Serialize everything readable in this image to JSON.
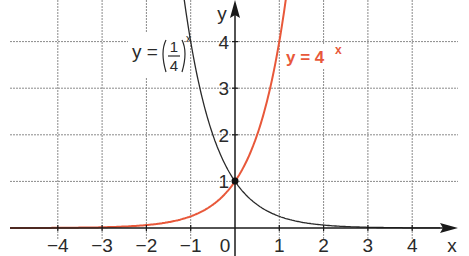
{
  "chart_data": {
    "type": "line",
    "title": "",
    "xlabel": "x",
    "ylabel": "y",
    "xlim": [
      -5,
      5
    ],
    "ylim": [
      0,
      5
    ],
    "grid": true,
    "x_ticks": [
      "-4",
      "-3",
      "-2",
      "-1",
      "0",
      "1",
      "2",
      "3",
      "4"
    ],
    "y_ticks": [
      "1",
      "2",
      "3",
      "4"
    ],
    "series": [
      {
        "name": "y = 4^x",
        "label": "y = 4",
        "label_exp": "x",
        "color": "#e8583a",
        "x": [
          -5,
          -4,
          -3,
          -2,
          -1,
          -0.5,
          0,
          0.5,
          1,
          1.1
        ],
        "values": [
          0.001,
          0.004,
          0.016,
          0.0625,
          0.25,
          0.5,
          1,
          2,
          4,
          4.59
        ]
      },
      {
        "name": "y = (1/4)^x",
        "label_prefix": "y =",
        "label_num": "1",
        "label_den": "4",
        "label_exp": "x",
        "color": "#2a2a2a",
        "x": [
          -1.1,
          -1,
          -0.5,
          0,
          0.5,
          1,
          2,
          3,
          4,
          5
        ],
        "values": [
          4.59,
          4,
          2,
          1,
          0.5,
          0.25,
          0.0625,
          0.016,
          0.004,
          0.001
        ]
      }
    ],
    "annotations": [
      {
        "text": "intersection point",
        "x": 0,
        "y": 1
      }
    ]
  },
  "axes": {
    "x_label": "x",
    "y_label": "y",
    "origin_label": "0"
  },
  "labels": {
    "red_curve": "y = 4",
    "red_exp": "x",
    "black_prefix": "y =",
    "black_num": "1",
    "black_den": "4",
    "black_exp": "x"
  }
}
